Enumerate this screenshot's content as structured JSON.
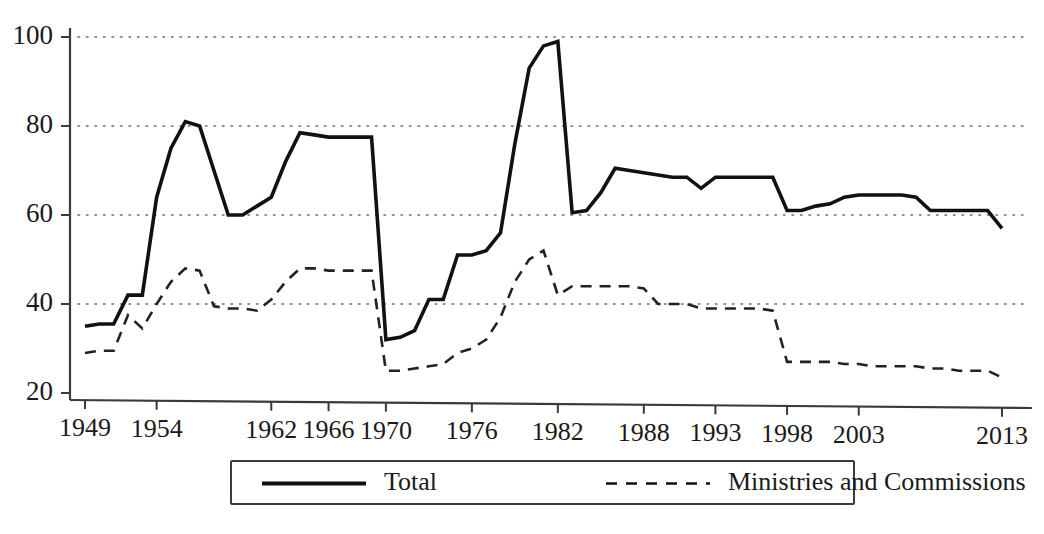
{
  "chart_data": {
    "type": "line",
    "title": "",
    "subtitle": "",
    "xlabel": "",
    "ylabel": "",
    "xlim": [
      1949,
      2013
    ],
    "ylim": [
      20,
      100
    ],
    "grid": true,
    "grid_axis": "y",
    "legend_position": "bottom",
    "y_ticks": [
      20,
      40,
      60,
      80,
      100
    ],
    "y_tick_labels": [
      "20",
      "40",
      "60",
      "80",
      "100"
    ],
    "x_ticks": [
      1949,
      1954,
      1962,
      1966,
      1970,
      1976,
      1982,
      1988,
      1993,
      1998,
      2003,
      2013
    ],
    "x_tick_labels": [
      "1949",
      "1954",
      "1962",
      "1966",
      "1970",
      "1976",
      "1982",
      "1988",
      "1993",
      "1998",
      "2003",
      "2013"
    ],
    "series": [
      {
        "name": "Total",
        "style": "solid",
        "color": "#111111",
        "x": [
          1949,
          1950,
          1951,
          1952,
          1953,
          1954,
          1955,
          1956,
          1957,
          1958,
          1959,
          1960,
          1961,
          1962,
          1963,
          1964,
          1965,
          1966,
          1967,
          1968,
          1969,
          1970,
          1971,
          1972,
          1973,
          1974,
          1975,
          1976,
          1977,
          1978,
          1979,
          1980,
          1981,
          1982,
          1983,
          1984,
          1985,
          1986,
          1987,
          1988,
          1989,
          1990,
          1991,
          1992,
          1993,
          1994,
          1995,
          1996,
          1997,
          1998,
          1999,
          2000,
          2001,
          2002,
          2003,
          2004,
          2005,
          2006,
          2007,
          2008,
          2009,
          2010,
          2011,
          2012,
          2013
        ],
        "values": [
          35,
          35.5,
          35.5,
          42,
          42,
          64,
          75,
          81,
          80,
          70,
          60,
          60,
          62,
          64,
          72,
          78.5,
          78,
          77.5,
          77.5,
          77.5,
          77.5,
          32,
          32.5,
          34,
          41,
          41,
          51,
          51,
          52,
          56,
          76,
          93,
          98,
          99,
          60.5,
          61,
          65,
          70.5,
          70,
          69.5,
          69,
          68.5,
          68.5,
          66,
          68.5,
          68.5,
          68.5,
          68.5,
          68.5,
          61,
          61,
          62,
          62.5,
          64,
          64.5,
          64.5,
          64.5,
          64.5,
          64,
          61,
          61,
          61,
          61,
          61,
          57
        ]
      },
      {
        "name": "Ministries and Commissions",
        "style": "dashed",
        "color": "#222222",
        "x": [
          1949,
          1950,
          1951,
          1952,
          1953,
          1954,
          1955,
          1956,
          1957,
          1958,
          1959,
          1960,
          1961,
          1962,
          1963,
          1964,
          1965,
          1966,
          1967,
          1968,
          1969,
          1970,
          1971,
          1972,
          1973,
          1974,
          1975,
          1976,
          1977,
          1978,
          1979,
          1980,
          1981,
          1982,
          1983,
          1984,
          1985,
          1986,
          1987,
          1988,
          1989,
          1990,
          1991,
          1992,
          1993,
          1994,
          1995,
          1996,
          1997,
          1998,
          1999,
          2000,
          2001,
          2002,
          2003,
          2004,
          2005,
          2006,
          2007,
          2008,
          2009,
          2010,
          2011,
          2012,
          2013
        ],
        "values": [
          29,
          29.5,
          29.5,
          37.5,
          34.5,
          40,
          45,
          48,
          47.5,
          39.5,
          39,
          39,
          38.5,
          41,
          45,
          48,
          48,
          47.5,
          47.5,
          47.5,
          47.5,
          25,
          25,
          25.5,
          26,
          26.5,
          29,
          30,
          32,
          37,
          45,
          50,
          52,
          42,
          44,
          44,
          44,
          44,
          44,
          43.5,
          40,
          40,
          40,
          39,
          39,
          39,
          39,
          39,
          38.5,
          27,
          27,
          27,
          27,
          26.5,
          26.5,
          26,
          26,
          26,
          26,
          25.5,
          25.5,
          25,
          25,
          25,
          23.5
        ]
      }
    ],
    "legend": [
      {
        "label": "Total",
        "style": "solid"
      },
      {
        "label": "Ministries and Commissions",
        "style": "dashed"
      }
    ]
  }
}
